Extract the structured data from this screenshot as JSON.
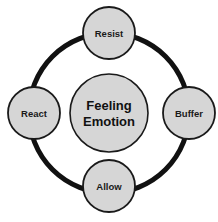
{
  "diagram": {
    "background_color": "#ffffff",
    "ring": {
      "color": "#111111",
      "stroke_width": 5,
      "center_x": 109,
      "center_y": 113,
      "radius": 80
    },
    "center_node": {
      "name": "center-node",
      "line1": "Feeling",
      "line2": "Emotion",
      "fill_color": "#d6d6d6",
      "border_color": "#1a1a1a",
      "radius": 39,
      "cx": 109,
      "cy": 113,
      "font_size": 13
    },
    "nodes": [
      {
        "id": "resist",
        "label": "Resist",
        "position": "top",
        "cx": 109,
        "cy": 33,
        "radius": 26,
        "fill_color": "#d6d6d6",
        "border_color": "#1a1a1a",
        "font_size": 9.5
      },
      {
        "id": "buffer",
        "label": "Buffer",
        "position": "right",
        "cx": 189,
        "cy": 113,
        "radius": 26,
        "fill_color": "#d6d6d6",
        "border_color": "#1a1a1a",
        "font_size": 9.5
      },
      {
        "id": "allow",
        "label": "Allow",
        "position": "bottom",
        "cx": 109,
        "cy": 186,
        "radius": 26,
        "fill_color": "#d6d6d6",
        "border_color": "#1a1a1a",
        "font_size": 9.5
      },
      {
        "id": "react",
        "label": "React",
        "position": "left",
        "cx": 34,
        "cy": 113,
        "radius": 26,
        "fill_color": "#d6d6d6",
        "border_color": "#1a1a1a",
        "font_size": 9.5
      }
    ]
  }
}
